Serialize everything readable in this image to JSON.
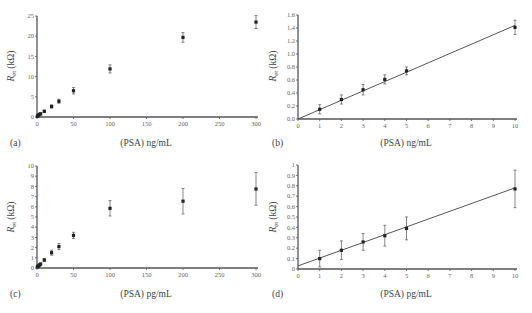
{
  "chart_data": [
    {
      "panel": "(a)",
      "type": "scatter",
      "xlabel": "(PSA) ng/mL",
      "ylabel": "R_et (kΩ)",
      "xlim": [
        0,
        300
      ],
      "ylim": [
        0,
        25
      ],
      "xticks": [
        0,
        50,
        100,
        150,
        200,
        250,
        300
      ],
      "yticks": [
        0,
        5,
        10,
        15,
        20,
        25
      ],
      "grid": false,
      "fit_line": false,
      "x": [
        0.5,
        1,
        2,
        3,
        4,
        5,
        10,
        20,
        30,
        50,
        100,
        200,
        300
      ],
      "y": [
        0.15,
        0.3,
        0.45,
        0.6,
        0.7,
        0.8,
        1.4,
        2.6,
        3.9,
        6.5,
        11.9,
        19.7,
        23.5
      ],
      "err": [
        0.05,
        0.1,
        0.1,
        0.1,
        0.1,
        0.1,
        0.3,
        0.4,
        0.5,
        0.8,
        1.0,
        1.2,
        1.6
      ]
    },
    {
      "panel": "(b)",
      "type": "scatter",
      "xlabel": "(PSA) ng/mL",
      "ylabel": "R_et (kΩ)",
      "xlim": [
        0,
        10
      ],
      "ylim": [
        0,
        1.6
      ],
      "xticks": [
        0,
        1,
        2,
        3,
        4,
        5,
        6,
        7,
        8,
        9,
        10
      ],
      "yticks": [
        "0.0",
        "0.2",
        "0.4",
        "0.6",
        "0.8",
        "1.0",
        "1.2",
        "1.4",
        "1.6"
      ],
      "grid": false,
      "fit_line": {
        "x0": 0,
        "y0": 0.0,
        "x1": 10,
        "y1": 1.44
      },
      "x": [
        1,
        2,
        3,
        4,
        5,
        10
      ],
      "y": [
        0.15,
        0.3,
        0.45,
        0.61,
        0.74,
        1.41
      ],
      "err": [
        0.07,
        0.07,
        0.08,
        0.07,
        0.06,
        0.11
      ]
    },
    {
      "panel": "(c)",
      "type": "scatter",
      "xlabel": "(PSA) pg/mL",
      "ylabel": "R_et (kΩ)",
      "xlim": [
        0,
        300
      ],
      "ylim": [
        0,
        10
      ],
      "xticks": [
        0,
        50,
        100,
        150,
        200,
        250,
        300
      ],
      "yticks": [
        0,
        1,
        2,
        3,
        4,
        5,
        6,
        7,
        8,
        9,
        10
      ],
      "grid": false,
      "fit_line": false,
      "x": [
        0.5,
        1,
        2,
        3,
        4,
        5,
        10,
        20,
        30,
        50,
        100,
        200,
        300
      ],
      "y": [
        0.1,
        0.15,
        0.2,
        0.27,
        0.33,
        0.4,
        0.78,
        1.5,
        2.1,
        3.2,
        5.85,
        6.55,
        7.75
      ],
      "err": [
        0.05,
        0.05,
        0.05,
        0.05,
        0.05,
        0.05,
        0.15,
        0.25,
        0.3,
        0.3,
        0.75,
        1.25,
        1.6
      ]
    },
    {
      "panel": "(d)",
      "type": "scatter",
      "xlabel": "(PSA) pg/mL",
      "ylabel": "R_et (kΩ)",
      "xlim": [
        0,
        10
      ],
      "ylim": [
        0,
        1
      ],
      "xticks": [
        0,
        1,
        2,
        3,
        4,
        5,
        6,
        7,
        8,
        9,
        10
      ],
      "yticks": [
        "0",
        "0.1",
        "0.2",
        "0.3",
        "0.4",
        "0.5",
        "0.6",
        "0.7",
        "0.8",
        "0.9",
        "1"
      ],
      "grid": false,
      "fit_line": {
        "x0": 0,
        "y0": 0.03,
        "x1": 10,
        "y1": 0.78
      },
      "x": [
        1,
        2,
        3,
        4,
        5,
        10
      ],
      "y": [
        0.1,
        0.18,
        0.26,
        0.32,
        0.39,
        0.77
      ],
      "err": [
        0.08,
        0.09,
        0.08,
        0.1,
        0.11,
        0.18
      ]
    }
  ],
  "figure": {
    "axis_color": "#555555",
    "marker_color": "#222222",
    "text_color": "#555555"
  }
}
